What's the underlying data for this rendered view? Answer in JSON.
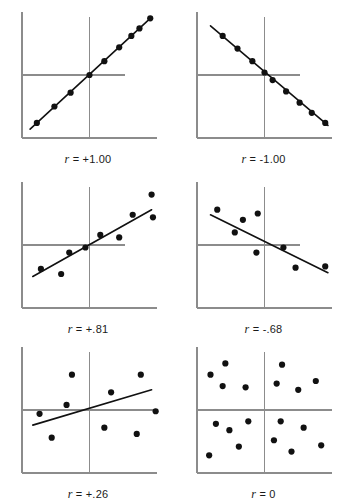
{
  "figure": {
    "title": "",
    "background": "#ffffff",
    "axis_color": "#8c8c8c",
    "point_color": "#111111",
    "line_color": "#111111",
    "label_color": "#1a1a1a",
    "panel_width": 145,
    "panel_height": 140
  },
  "chart_data": {
    "type": "scatter",
    "title": "",
    "xlabel": "",
    "ylabel": "",
    "grid": false,
    "legend": "none",
    "xlim": [
      0,
      100
    ],
    "ylim": [
      0,
      100
    ],
    "note": "Six scatterplots illustrating different Pearson correlation coefficients, each with a vertical and a horizontal reference line through the means and a fitted regression line.",
    "panels": [
      {
        "id": "panel-r-plus-1-00",
        "label": "r = +1.00",
        "r_symbol": "r",
        "r_relation": "=",
        "r_value": "+1.00",
        "r_numeric": 1.0,
        "position": "top-left",
        "vline_x": 50,
        "hline_y": 50,
        "hline_x_end": 76,
        "vline_y_top": 96,
        "regression": {
          "x1": 6,
          "y1": 7,
          "x2": 96,
          "y2": 96
        },
        "points": [
          {
            "x": 11,
            "y": 12
          },
          {
            "x": 24,
            "y": 25
          },
          {
            "x": 36,
            "y": 36
          },
          {
            "x": 50,
            "y": 50
          },
          {
            "x": 61,
            "y": 61
          },
          {
            "x": 72,
            "y": 72
          },
          {
            "x": 81,
            "y": 81
          },
          {
            "x": 87,
            "y": 87
          },
          {
            "x": 95,
            "y": 95
          }
        ]
      },
      {
        "id": "panel-r-minus-1-00",
        "label": "r = -1.00",
        "r_symbol": "r",
        "r_relation": "=",
        "r_value": "-1.00",
        "r_numeric": -1.0,
        "position": "top-right",
        "vline_x": 50,
        "hline_y": 50,
        "hline_x_end": 76,
        "vline_y_top": 96,
        "regression": {
          "x1": 10,
          "y1": 89,
          "x2": 97,
          "y2": 10
        },
        "points": [
          {
            "x": 19,
            "y": 81
          },
          {
            "x": 30,
            "y": 71
          },
          {
            "x": 41,
            "y": 61
          },
          {
            "x": 50,
            "y": 52
          },
          {
            "x": 56,
            "y": 46
          },
          {
            "x": 66,
            "y": 37
          },
          {
            "x": 76,
            "y": 28
          },
          {
            "x": 85,
            "y": 20
          },
          {
            "x": 95,
            "y": 12
          }
        ]
      },
      {
        "id": "panel-r-plus-0-81",
        "label": "r = +.81",
        "r_symbol": "r",
        "r_relation": "=",
        "r_value": "+.81",
        "r_numeric": 0.81,
        "position": "middle-left",
        "vline_x": 50,
        "hline_y": 50,
        "hline_x_end": 76,
        "vline_y_top": 96,
        "regression": {
          "x1": 8,
          "y1": 25,
          "x2": 96,
          "y2": 78
        },
        "points": [
          {
            "x": 14,
            "y": 31
          },
          {
            "x": 29,
            "y": 27
          },
          {
            "x": 35,
            "y": 44
          },
          {
            "x": 47,
            "y": 48
          },
          {
            "x": 58,
            "y": 58
          },
          {
            "x": 72,
            "y": 56
          },
          {
            "x": 82,
            "y": 74
          },
          {
            "x": 96,
            "y": 90
          },
          {
            "x": 97,
            "y": 72
          }
        ]
      },
      {
        "id": "panel-r-minus-0-68",
        "label": "r = -.68",
        "r_symbol": "r",
        "r_relation": "=",
        "r_value": "-.68",
        "r_numeric": -0.68,
        "position": "middle-right",
        "vline_x": 50,
        "hline_y": 50,
        "hline_x_end": 76,
        "vline_y_top": 96,
        "regression": {
          "x1": 10,
          "y1": 74,
          "x2": 97,
          "y2": 28
        },
        "points": [
          {
            "x": 15,
            "y": 78
          },
          {
            "x": 28,
            "y": 60
          },
          {
            "x": 34,
            "y": 70
          },
          {
            "x": 45,
            "y": 75
          },
          {
            "x": 44,
            "y": 44
          },
          {
            "x": 64,
            "y": 48
          },
          {
            "x": 73,
            "y": 32
          },
          {
            "x": 95,
            "y": 33
          }
        ]
      },
      {
        "id": "panel-r-plus-0-26",
        "label": "r = +.26",
        "r_symbol": "r",
        "r_relation": "=",
        "r_value": "+.26",
        "r_numeric": 0.26,
        "position": "bottom-left",
        "vline_x": 50,
        "hline_y": 50,
        "hline_x_end": 100,
        "vline_y_top": 96,
        "regression": {
          "x1": 8,
          "y1": 38,
          "x2": 96,
          "y2": 66
        },
        "points": [
          {
            "x": 13,
            "y": 47
          },
          {
            "x": 22,
            "y": 28
          },
          {
            "x": 33,
            "y": 54
          },
          {
            "x": 37,
            "y": 78
          },
          {
            "x": 61,
            "y": 36
          },
          {
            "x": 66,
            "y": 64
          },
          {
            "x": 85,
            "y": 31
          },
          {
            "x": 88,
            "y": 78
          },
          {
            "x": 99,
            "y": 49
          }
        ]
      },
      {
        "id": "panel-r-zero",
        "label": "r = 0",
        "r_symbol": "r",
        "r_relation": "=",
        "r_value": "0",
        "r_numeric": 0,
        "position": "bottom-right",
        "vline_x": 50,
        "hline_y": 50,
        "hline_x_end": 100,
        "vline_y_top": 96,
        "regression": null,
        "points": [
          {
            "x": 10,
            "y": 78
          },
          {
            "x": 21,
            "y": 87
          },
          {
            "x": 19,
            "y": 69
          },
          {
            "x": 36,
            "y": 68
          },
          {
            "x": 14,
            "y": 39
          },
          {
            "x": 24,
            "y": 34
          },
          {
            "x": 38,
            "y": 41
          },
          {
            "x": 9,
            "y": 14
          },
          {
            "x": 31,
            "y": 21
          },
          {
            "x": 63,
            "y": 86
          },
          {
            "x": 59,
            "y": 71
          },
          {
            "x": 75,
            "y": 66
          },
          {
            "x": 88,
            "y": 73
          },
          {
            "x": 62,
            "y": 41
          },
          {
            "x": 79,
            "y": 36
          },
          {
            "x": 57,
            "y": 26
          },
          {
            "x": 70,
            "y": 17
          },
          {
            "x": 92,
            "y": 22
          }
        ]
      }
    ]
  }
}
